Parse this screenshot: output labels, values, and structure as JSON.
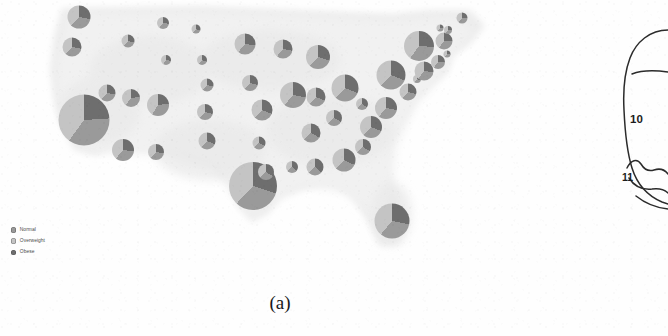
{
  "figure": {
    "caption": "(a)",
    "panel_kind": "choropleth-pie-map"
  },
  "legend": {
    "items": [
      {
        "label": "Normal",
        "color": "#9a9a9a",
        "key": "normal"
      },
      {
        "label": "Overweight",
        "color": "#c4c4c4",
        "key": "overweight"
      },
      {
        "label": "Obese",
        "color": "#6e6e6e",
        "key": "obese"
      }
    ]
  },
  "right_diagram": {
    "labels": [
      {
        "text": "10",
        "name": "region-label-10"
      },
      {
        "text": "11",
        "name": "region-label-11"
      }
    ]
  },
  "chart_data": {
    "type": "pie",
    "title": "",
    "subtitle": "",
    "xlabel": "",
    "ylabel": "",
    "legend_position": "bottom-left",
    "grid": false,
    "series_names": [
      "Normal",
      "Overweight",
      "Obese"
    ],
    "series_colors": [
      "#9a9a9a",
      "#c4c4c4",
      "#6e6e6e"
    ],
    "encoding": {
      "position": "state centroid on US map",
      "radius": "proportional to state population",
      "angle": "share of adults in each BMI category"
    },
    "note": "One pie per US state; slices ordered Obese (from 12 o'clock, counter-clockwise), then Normal, then Overweight.",
    "pies": [
      {
        "state": "WA",
        "x": 79,
        "y": 17,
        "r": 11.5,
        "values": [
          34,
          38,
          28
        ]
      },
      {
        "state": "OR",
        "x": 72,
        "y": 47,
        "r": 9.5,
        "values": [
          34,
          38,
          28
        ]
      },
      {
        "state": "CA",
        "x": 84,
        "y": 120,
        "r": 25.5,
        "values": [
          36,
          40,
          24
        ]
      },
      {
        "state": "NV",
        "x": 107,
        "y": 93,
        "r": 8.5,
        "values": [
          33,
          39,
          28
        ]
      },
      {
        "state": "ID",
        "x": 128,
        "y": 41,
        "r": 6.5,
        "values": [
          32,
          39,
          29
        ]
      },
      {
        "state": "MT",
        "x": 163,
        "y": 23,
        "r": 6.0,
        "values": [
          33,
          40,
          27
        ]
      },
      {
        "state": "WY",
        "x": 166,
        "y": 60,
        "r": 5.0,
        "values": [
          31,
          41,
          28
        ]
      },
      {
        "state": "UT",
        "x": 131,
        "y": 98,
        "r": 9.0,
        "values": [
          37,
          40,
          23
        ]
      },
      {
        "state": "AZ",
        "x": 123,
        "y": 150,
        "r": 11.0,
        "values": [
          34,
          39,
          27
        ]
      },
      {
        "state": "CO",
        "x": 158,
        "y": 105,
        "r": 11.0,
        "values": [
          36,
          41,
          23
        ]
      },
      {
        "state": "NM",
        "x": 156,
        "y": 152,
        "r": 8.0,
        "values": [
          33,
          39,
          28
        ]
      },
      {
        "state": "ND",
        "x": 196,
        "y": 29,
        "r": 4.5,
        "values": [
          31,
          38,
          31
        ]
      },
      {
        "state": "SD",
        "x": 202,
        "y": 60,
        "r": 5.0,
        "values": [
          31,
          38,
          31
        ]
      },
      {
        "state": "NE",
        "x": 207,
        "y": 85,
        "r": 6.5,
        "values": [
          32,
          39,
          29
        ]
      },
      {
        "state": "KS",
        "x": 205,
        "y": 112,
        "r": 8.0,
        "values": [
          32,
          39,
          29
        ]
      },
      {
        "state": "OK",
        "x": 207,
        "y": 141,
        "r": 8.5,
        "values": [
          31,
          38,
          31
        ]
      },
      {
        "state": "TX",
        "x": 253,
        "y": 186,
        "r": 24.0,
        "values": [
          32,
          38,
          30
        ]
      },
      {
        "state": "MN",
        "x": 245,
        "y": 44,
        "r": 10.5,
        "values": [
          34,
          39,
          27
        ]
      },
      {
        "state": "IA",
        "x": 250,
        "y": 83,
        "r": 8.0,
        "values": [
          32,
          39,
          29
        ]
      },
      {
        "state": "MO",
        "x": 262,
        "y": 110,
        "r": 10.5,
        "values": [
          31,
          38,
          31
        ]
      },
      {
        "state": "AR",
        "x": 259,
        "y": 143,
        "r": 6.5,
        "values": [
          30,
          37,
          33
        ]
      },
      {
        "state": "LA",
        "x": 266,
        "y": 172,
        "r": 8.0,
        "values": [
          29,
          37,
          34
        ]
      },
      {
        "state": "WI",
        "x": 283,
        "y": 49,
        "r": 9.5,
        "values": [
          33,
          39,
          28
        ]
      },
      {
        "state": "IL",
        "x": 293,
        "y": 95,
        "r": 13.0,
        "values": [
          33,
          39,
          28
        ]
      },
      {
        "state": "MS",
        "x": 292,
        "y": 167,
        "r": 6.0,
        "values": [
          27,
          36,
          37
        ]
      },
      {
        "state": "MI",
        "x": 318,
        "y": 57,
        "r": 12.0,
        "values": [
          32,
          38,
          30
        ]
      },
      {
        "state": "IN",
        "x": 316,
        "y": 97,
        "r": 9.5,
        "values": [
          31,
          38,
          31
        ]
      },
      {
        "state": "TN",
        "x": 311,
        "y": 133,
        "r": 9.5,
        "values": [
          30,
          37,
          33
        ]
      },
      {
        "state": "AL",
        "x": 315,
        "y": 167,
        "r": 8.5,
        "values": [
          28,
          36,
          36
        ]
      },
      {
        "state": "KY",
        "x": 334,
        "y": 118,
        "r": 8.0,
        "values": [
          30,
          37,
          33
        ]
      },
      {
        "state": "OH",
        "x": 345,
        "y": 88,
        "r": 13.5,
        "values": [
          31,
          38,
          31
        ]
      },
      {
        "state": "GA",
        "x": 344,
        "y": 160,
        "r": 11.5,
        "values": [
          30,
          38,
          32
        ]
      },
      {
        "state": "FL",
        "x": 392,
        "y": 221,
        "r": 17.5,
        "values": [
          33,
          39,
          28
        ]
      },
      {
        "state": "SC",
        "x": 363,
        "y": 147,
        "r": 8.0,
        "values": [
          29,
          37,
          34
        ]
      },
      {
        "state": "NC",
        "x": 371,
        "y": 127,
        "r": 11.0,
        "values": [
          31,
          38,
          31
        ]
      },
      {
        "state": "WV",
        "x": 362,
        "y": 104,
        "r": 6.0,
        "values": [
          29,
          37,
          34
        ]
      },
      {
        "state": "VA",
        "x": 386,
        "y": 108,
        "r": 11.0,
        "values": [
          33,
          39,
          28
        ]
      },
      {
        "state": "PA",
        "x": 391,
        "y": 75,
        "r": 14.5,
        "values": [
          31,
          38,
          31
        ]
      },
      {
        "state": "MD",
        "x": 408,
        "y": 92,
        "r": 8.5,
        "values": [
          32,
          39,
          29
        ]
      },
      {
        "state": "DE",
        "x": 417,
        "y": 79,
        "r": 4.0,
        "values": [
          31,
          38,
          31
        ]
      },
      {
        "state": "NJ",
        "x": 424,
        "y": 71,
        "r": 9.5,
        "values": [
          33,
          40,
          27
        ]
      },
      {
        "state": "NY",
        "x": 419,
        "y": 46,
        "r": 15.0,
        "values": [
          34,
          40,
          26
        ]
      },
      {
        "state": "CT",
        "x": 438,
        "y": 62,
        "r": 7.0,
        "values": [
          34,
          40,
          26
        ]
      },
      {
        "state": "RI",
        "x": 447,
        "y": 54,
        "r": 3.5,
        "values": [
          33,
          39,
          28
        ]
      },
      {
        "state": "MA",
        "x": 444,
        "y": 41,
        "r": 8.5,
        "values": [
          35,
          40,
          25
        ]
      },
      {
        "state": "VT",
        "x": 440,
        "y": 28,
        "r": 3.5,
        "values": [
          34,
          41,
          25
        ]
      },
      {
        "state": "NH",
        "x": 448,
        "y": 30,
        "r": 4.0,
        "values": [
          34,
          41,
          25
        ]
      },
      {
        "state": "ME",
        "x": 462,
        "y": 18,
        "r": 5.5,
        "values": [
          34,
          40,
          26
        ]
      }
    ]
  }
}
